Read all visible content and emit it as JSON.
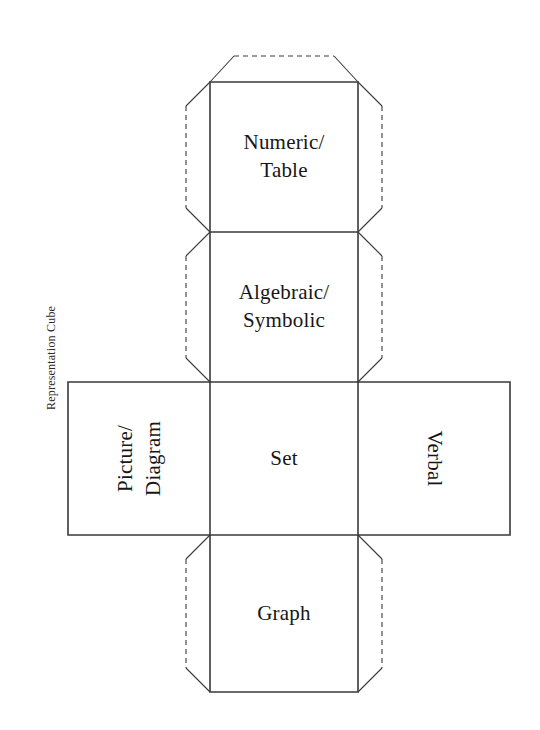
{
  "figure": {
    "caption": "Representation Cube",
    "background_color": "#ffffff",
    "line_color": "#333333",
    "text_color": "#161616",
    "solid_edge_style": "solid",
    "flap_edge_style": "dashed",
    "net_type": "cube-net-cross"
  },
  "faces": {
    "top": "Numeric/\nTable",
    "upper_middle": "Algebraic/\nSymbolic",
    "left": "Picture/\nDiagram",
    "center": "Set",
    "right": "Verbal",
    "bottom": "Graph"
  },
  "face_list": [
    {
      "id": "numeric-table",
      "label": "Numeric/\nTable",
      "position": "column-row-1",
      "rotation": 0
    },
    {
      "id": "algebraic-symbolic",
      "label": "Algebraic/\nSymbolic",
      "position": "column-row-2",
      "rotation": 0
    },
    {
      "id": "picture-diagram",
      "label": "Picture/\nDiagram",
      "position": "row-left",
      "rotation": -90
    },
    {
      "id": "set",
      "label": "Set",
      "position": "column-row-3",
      "rotation": 0
    },
    {
      "id": "verbal",
      "label": "Verbal",
      "position": "row-right",
      "rotation": 90
    },
    {
      "id": "graph",
      "label": "Graph",
      "position": "column-row-4",
      "rotation": 0
    }
  ]
}
